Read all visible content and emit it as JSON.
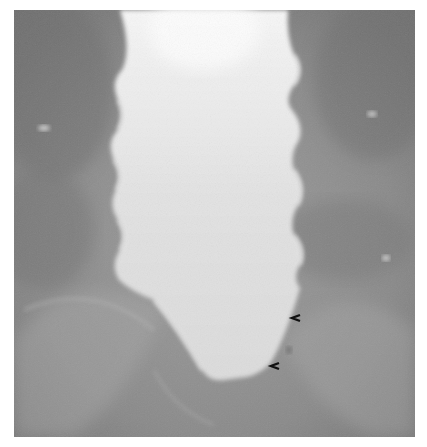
{
  "image": {
    "kind": "grayscale radiograph",
    "subject": "barium-filled colon segment with lobulated margins",
    "background_color": "#8a8a8a",
    "structure_color": "#e4e4e4"
  },
  "annotations": {
    "arrowheads": [
      {
        "label": "arrowhead-upper",
        "symbol": "˂",
        "x": 296,
        "y": 321,
        "direction": "left"
      },
      {
        "label": "arrowhead-lower",
        "symbol": "˂",
        "x": 276,
        "y": 369,
        "direction": "left"
      }
    ]
  }
}
